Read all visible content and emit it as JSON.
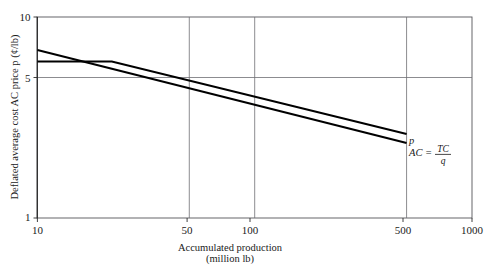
{
  "chart_data": {
    "type": "line",
    "title": "",
    "xlabel": "Accumulated production",
    "xlabel_sub": "(million lb)",
    "ylabel": "Deflated average cost AC price p (¢/lb)",
    "xscale": "log",
    "yscale": "log",
    "xlim": [
      10,
      1000
    ],
    "ylim": [
      1,
      10
    ],
    "grid": true,
    "grid_lines_x": [
      50,
      100,
      500
    ],
    "grid_lines_y": [
      5
    ],
    "xticks": [
      "10",
      "50",
      "100",
      "500",
      "1000"
    ],
    "xtick_values": [
      10,
      50,
      100,
      500,
      1000
    ],
    "yticks": [
      "1",
      "5",
      "10"
    ],
    "ytick_values": [
      1,
      5,
      10
    ],
    "legend_position": "inline-right",
    "series": [
      {
        "name": "p",
        "label": "p",
        "label_kind": "italic",
        "points": [
          {
            "x": 10,
            "y": 6.0
          },
          {
            "x": 22,
            "y": 6.0
          },
          {
            "x": 500,
            "y": 2.62
          }
        ]
      },
      {
        "name": "AC",
        "label": "AC =",
        "label_kind": "fraction",
        "fraction_numerator": "TC",
        "fraction_denominator": "q",
        "points": [
          {
            "x": 10,
            "y": 6.85
          },
          {
            "x": 500,
            "y": 2.36
          }
        ]
      }
    ],
    "annotations": [
      {
        "name": "p-label",
        "text": "p",
        "x": 500,
        "y": 2.62
      },
      {
        "name": "ac-label",
        "text": "AC = TC/q",
        "x": 500,
        "y": 2.36
      }
    ]
  }
}
